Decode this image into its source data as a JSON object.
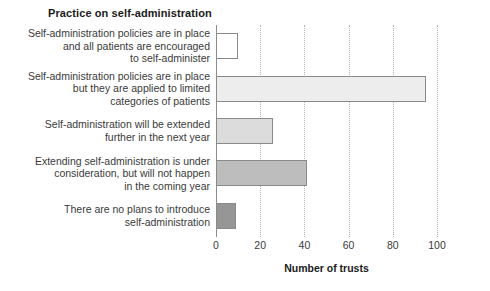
{
  "chart_data": {
    "type": "bar",
    "orientation": "horizontal",
    "title": "Practice on self-administration",
    "xlabel": "Number of trusts",
    "ylabel": "",
    "xlim": [
      0,
      100
    ],
    "xticks": [
      0,
      20,
      40,
      60,
      80,
      100
    ],
    "grid": "vertical-dotted",
    "legend": "none",
    "categories": [
      "Self-administration policies are in place and all patients are encouraged to self-administer",
      "Self-administration policies are in place but they are applied to limited categories of patients",
      "Self-administration will be extended further in the next year",
      "Extending self-administration is under consideration, but will not happen in the coming year",
      "There are no plans to introduce self-administration"
    ],
    "category_lines": [
      [
        "Self-administration policies are in place",
        "and all patients are encouraged",
        "to self-administer"
      ],
      [
        "Self-administration policies are in place",
        "but they are applied to limited",
        "categories of patients"
      ],
      [
        "Self-administration will be extended",
        "further in the next year"
      ],
      [
        "Extending self-administration is under",
        "consideration, but will not happen",
        "in the coming year"
      ],
      [
        "There are no plans to introduce",
        "self-administration"
      ]
    ],
    "values": [
      10,
      95,
      26,
      41,
      9
    ],
    "bar_colors": [
      "#ffffff",
      "#ededed",
      "#dcdcdc",
      "#bdbdbd",
      "#969696"
    ],
    "bar_edge_color": "#8a8a8a",
    "axis_color": "#8c8c8c",
    "gridline_color": "#b4b4b4",
    "text_color": "#3a3a3a",
    "title_color": "#1a1a1a",
    "background": "#ffffff"
  }
}
